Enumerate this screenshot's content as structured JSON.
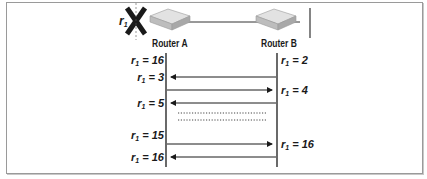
{
  "diagram": {
    "routers": [
      {
        "id": "router-a",
        "label": "Router A",
        "failed_route": "r1"
      },
      {
        "id": "router-b",
        "label": "Router B"
      }
    ],
    "failure_marker": {
      "label_var": "r",
      "label_sub": "1",
      "icon": "x-cross-icon"
    },
    "left_labels": [
      {
        "var": "r",
        "sub": "1",
        "text": " = 16"
      },
      {
        "var": "r",
        "sub": "1",
        "text": " = 3"
      },
      {
        "var": "r",
        "sub": "1",
        "text": " = 5"
      },
      {
        "var": "r",
        "sub": "1",
        "text": " = 15"
      },
      {
        "var": "r",
        "sub": "1",
        "text": " = 16"
      }
    ],
    "right_labels": [
      {
        "var": "r",
        "sub": "1",
        "text": " = 2"
      },
      {
        "var": "r",
        "sub": "1",
        "text": " = 4"
      },
      {
        "var": "r",
        "sub": "1",
        "text": " = 16"
      }
    ],
    "messages": [
      {
        "from": "Router B",
        "to": "Router A",
        "direction": "left"
      },
      {
        "from": "Router A",
        "to": "Router B",
        "direction": "right"
      },
      {
        "from": "Router B",
        "to": "Router A",
        "direction": "left"
      },
      {
        "from": "Router A",
        "to": "Router B",
        "direction": "right"
      },
      {
        "from": "Router B",
        "to": "Router A",
        "direction": "left"
      }
    ],
    "ellipsis": "repeated exchanges (dotted)",
    "colors": {
      "line": "#1a1a1a",
      "frame": "#9a9a9a",
      "router_body": "#cfcfcf",
      "x_mark": "#1a1a1a"
    }
  }
}
